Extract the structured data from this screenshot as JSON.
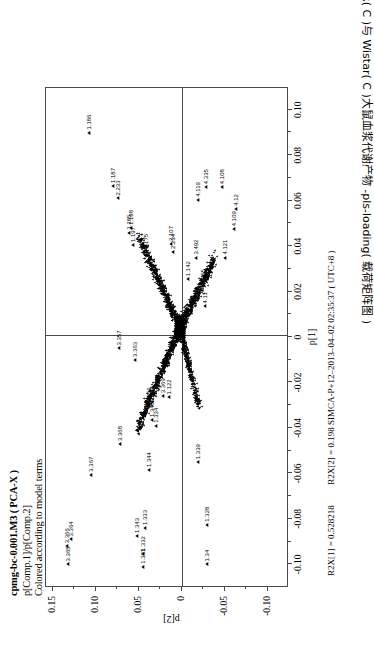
{
  "figure": {
    "title_lines": [
      "cpmg-bc-0.001.M3 ( PCA-X )",
      "p[Comp.1]/p[Comp.2]",
      "Colored according to model terms"
    ],
    "caption_number": "图 6-9",
    "caption_text": "SHR( C )与 Wistar( C )大鼠血浆代谢产物 -pls-loading( 载荷矩阵图 )",
    "footer": {
      "r2x1": "R2X[1] = 0.528218",
      "r2x2": "R2X[2] = 0.198",
      "software": "SIMCA-P+12",
      "timestamp": "2013-04-02 02:35:37 ( UTC+8 )",
      "combined_right": "R2X[2] = 0.198 SIMCA-P+12–2013–04–02 02:35:37 ( UTC+8 )"
    },
    "accent_color": "#000000",
    "frame_color": "#4a4a4a"
  },
  "chart_data": {
    "type": "scatter",
    "title": "cpmg-bc-0.001.M3 ( PCA-X )",
    "subtitle": "p[Comp.1]/p[Comp.2]",
    "annotation": "Colored according to model terms",
    "xlabel": "p[1]",
    "ylabel": "p[2]",
    "xlim": [
      -0.11,
      0.11
    ],
    "ylim": [
      -0.125,
      0.158
    ],
    "xticks": [
      -0.1,
      -0.08,
      -0.06,
      -0.04,
      -0.02,
      0,
      0.02,
      0.04,
      0.06,
      0.08,
      0.1
    ],
    "xticklabels": [
      "-0.10",
      "-0.08",
      "-0.06",
      "-0.04",
      "-0.02",
      "0",
      "0.02",
      "0.04",
      "0.06",
      "0.08",
      "0.10"
    ],
    "yticks": [
      0.15,
      0.1,
      0.05,
      0,
      -0.05,
      -0.1
    ],
    "yticklabels": [
      "0.15",
      "0.10",
      "0.05",
      "0",
      "-0.05",
      "-0.10"
    ],
    "grid": false,
    "legend": null,
    "marker": "triangle",
    "marker_color": "#000000",
    "labeled_points": [
      {
        "label": "3.365",
        "x": -0.1005,
        "y": 0.1325
      },
      {
        "label": "3.366",
        "x": -0.0925,
        "y": 0.134
      },
      {
        "label": "3.364",
        "x": -0.0895,
        "y": 0.1285
      },
      {
        "label": "3.367",
        "x": -0.061,
        "y": 0.106
      },
      {
        "label": "3.368",
        "x": -0.0475,
        "y": 0.0715
      },
      {
        "label": "3.369",
        "x": -0.0265,
        "y": 0.0215
      },
      {
        "label": "3.356",
        "x": -0.0305,
        "y": 0.0375
      },
      {
        "label": "3.363",
        "x": -0.0105,
        "y": 0.0545
      },
      {
        "label": "3.357",
        "x": -0.0055,
        "y": 0.0735
      },
      {
        "label": "1.331",
        "x": -0.1015,
        "y": 0.0455
      },
      {
        "label": "1.332",
        "x": -0.096,
        "y": 0.045
      },
      {
        "label": "1.343",
        "x": -0.088,
        "y": 0.052
      },
      {
        "label": "1.333",
        "x": -0.0845,
        "y": 0.043
      },
      {
        "label": "1.344",
        "x": -0.059,
        "y": 0.038
      },
      {
        "label": "1.334",
        "x": -0.0395,
        "y": 0.0295
      },
      {
        "label": "1.345",
        "x": -0.037,
        "y": 0.0345
      },
      {
        "label": "1.339",
        "x": -0.0555,
        "y": -0.0185
      },
      {
        "label": "1.34",
        "x": -0.1005,
        "y": -0.03
      },
      {
        "label": "1.328",
        "x": -0.083,
        "y": -0.03
      },
      {
        "label": "1.185",
        "x": 0.0455,
        "y": 0.061
      },
      {
        "label": "1.186",
        "x": 0.0895,
        "y": 0.1075
      },
      {
        "label": "1.187",
        "x": 0.066,
        "y": 0.08
      },
      {
        "label": "1.197",
        "x": 0.04,
        "y": 0.0565
      },
      {
        "label": "1.198",
        "x": 0.0475,
        "y": 0.0585
      },
      {
        "label": "2.233",
        "x": 0.0605,
        "y": 0.0745
      },
      {
        "label": "2.234",
        "x": 0.037,
        "y": 0.01
      },
      {
        "label": "2.107",
        "x": 0.0405,
        "y": 0.012
      },
      {
        "label": "4.119",
        "x": 0.06,
        "y": -0.0195
      },
      {
        "label": "4.335",
        "x": 0.0655,
        "y": -0.028
      },
      {
        "label": "4.108",
        "x": 0.0655,
        "y": -0.0465
      },
      {
        "label": "4.109",
        "x": 0.047,
        "y": -0.0605
      },
      {
        "label": "4.12",
        "x": 0.056,
        "y": -0.063
      },
      {
        "label": "4.121",
        "x": 0.0345,
        "y": -0.051
      },
      {
        "label": "4.11",
        "x": 0.013,
        "y": -0.027
      },
      {
        "label": "3.55",
        "x": 0.023,
        "y": -0.0245
      },
      {
        "label": "3.492",
        "x": 0.0345,
        "y": -0.0165
      },
      {
        "label": "1.175",
        "x": 0.037,
        "y": 0.042
      },
      {
        "label": "1.142",
        "x": 0.025,
        "y": -0.0075
      },
      {
        "label": "1.122",
        "x": -0.027,
        "y": 0.015
      }
    ],
    "cluster_description": "Dense V-shaped cloud of unlabeled triangular loading markers centred near p[1]=0.005, p[2]=0.005, spanning roughly p[1] -0.045..0.050 and p[2] -0.045..0.060"
  }
}
